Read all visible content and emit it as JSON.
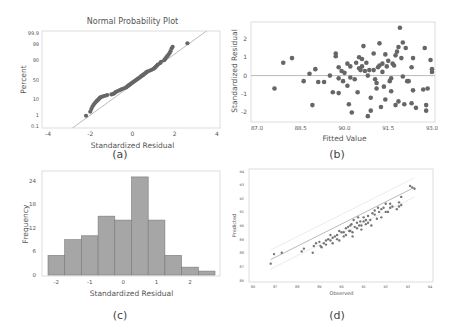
{
  "captions": {
    "a": "(a)",
    "b": "(b)",
    "c": "(c)",
    "d": "(d)"
  },
  "colors": {
    "marker": "#666666",
    "fit_line": "#bbbbbb",
    "bar_fill": "#a6a6a6",
    "bar_edge": "#7a7a7a",
    "frame": "#dddddd",
    "text": "#555555"
  },
  "chart_data": [
    {
      "id": "a",
      "type": "scatter",
      "title": "Normal Probability Plot",
      "xlabel": "Standardized Residual",
      "ylabel": "Percent",
      "xlim": [
        -4,
        4
      ],
      "xticks": [
        -4,
        -2,
        0,
        2,
        4
      ],
      "yticks": [
        0.1,
        1,
        10,
        50,
        90,
        99,
        99.9
      ],
      "ytick_labels": [
        "0.1",
        "1",
        "10",
        "50",
        "90",
        "99",
        "99.9"
      ],
      "grid": false,
      "reference_line": {
        "from": [
          -3.1,
          0.1
        ],
        "to": [
          3.1,
          99.9
        ]
      },
      "points": [
        [
          -2.2,
          0.8
        ],
        [
          -2.0,
          1.6
        ],
        [
          -1.95,
          2.5
        ],
        [
          -1.9,
          3.5
        ],
        [
          -1.85,
          4.5
        ],
        [
          -1.8,
          5.5
        ],
        [
          -1.75,
          6.5
        ],
        [
          -1.7,
          7.5
        ],
        [
          -1.65,
          8.5
        ],
        [
          -1.6,
          9.5
        ],
        [
          -1.55,
          11
        ],
        [
          -1.5,
          12
        ],
        [
          -1.4,
          13
        ],
        [
          -1.3,
          14
        ],
        [
          -1.2,
          15
        ],
        [
          -1.0,
          16
        ],
        [
          -0.9,
          17
        ],
        [
          -0.85,
          18.5
        ],
        [
          -0.8,
          20
        ],
        [
          -0.7,
          22
        ],
        [
          -0.6,
          24
        ],
        [
          -0.5,
          26
        ],
        [
          -0.4,
          28
        ],
        [
          -0.3,
          30
        ],
        [
          -0.25,
          32
        ],
        [
          -0.2,
          34
        ],
        [
          -0.15,
          36
        ],
        [
          -0.1,
          38
        ],
        [
          -0.05,
          40
        ],
        [
          0.0,
          42
        ],
        [
          0.05,
          44
        ],
        [
          0.1,
          46
        ],
        [
          0.15,
          48
        ],
        [
          0.2,
          50
        ],
        [
          0.25,
          52
        ],
        [
          0.3,
          54
        ],
        [
          0.35,
          56
        ],
        [
          0.4,
          58
        ],
        [
          0.45,
          60
        ],
        [
          0.5,
          62
        ],
        [
          0.55,
          64
        ],
        [
          0.6,
          66
        ],
        [
          0.65,
          68
        ],
        [
          0.7,
          70
        ],
        [
          0.8,
          72
        ],
        [
          0.9,
          74
        ],
        [
          1.0,
          76
        ],
        [
          1.05,
          78
        ],
        [
          1.1,
          80
        ],
        [
          1.15,
          82
        ],
        [
          1.2,
          84
        ],
        [
          1.3,
          86
        ],
        [
          1.35,
          88
        ],
        [
          1.5,
          90
        ],
        [
          1.55,
          91.5
        ],
        [
          1.6,
          93
        ],
        [
          1.65,
          94
        ],
        [
          1.7,
          95
        ],
        [
          1.75,
          96
        ],
        [
          1.8,
          97
        ],
        [
          1.85,
          98
        ],
        [
          1.9,
          98.5
        ],
        [
          2.6,
          99.2
        ]
      ]
    },
    {
      "id": "b",
      "type": "scatter",
      "title": "",
      "xlabel": "Fitted Value",
      "ylabel": "Standardized Residual",
      "xlim": [
        87.0,
        93.0
      ],
      "ylim": [
        -2.3,
        2.8
      ],
      "xticks": [
        87.0,
        88.5,
        90.0,
        91.5,
        93.0
      ],
      "xtick_labels": [
        "87.0",
        "88.5",
        "90.0",
        "91.5",
        "93.0"
      ],
      "yticks": [
        -2,
        -1,
        0,
        1,
        2
      ],
      "grid": false,
      "reference_line": {
        "y": 0
      },
      "points": [
        [
          87.6,
          -0.7
        ],
        [
          87.9,
          0.7
        ],
        [
          88.2,
          0.95
        ],
        [
          88.6,
          -0.3
        ],
        [
          88.8,
          0.1
        ],
        [
          88.9,
          -1.6
        ],
        [
          89.0,
          0.35
        ],
        [
          89.1,
          -0.35
        ],
        [
          89.3,
          -0.35
        ],
        [
          89.5,
          0.0
        ],
        [
          89.6,
          -0.9
        ],
        [
          89.7,
          1.2
        ],
        [
          89.7,
          1.05
        ],
        [
          89.8,
          0.45
        ],
        [
          89.8,
          -0.15
        ],
        [
          89.8,
          -0.95
        ],
        [
          89.9,
          0.25
        ],
        [
          89.95,
          -0.3
        ],
        [
          90.0,
          0.15
        ],
        [
          90.1,
          0.65
        ],
        [
          90.1,
          -0.55
        ],
        [
          90.15,
          -1.55
        ],
        [
          90.2,
          0.5
        ],
        [
          90.2,
          -0.1
        ],
        [
          90.25,
          -2.0
        ],
        [
          90.35,
          -0.2
        ],
        [
          90.4,
          0.7
        ],
        [
          90.45,
          -0.9
        ],
        [
          90.5,
          1.0
        ],
        [
          90.5,
          0.4
        ],
        [
          90.55,
          0.3
        ],
        [
          90.6,
          0.9
        ],
        [
          90.6,
          0.5
        ],
        [
          90.65,
          1.6
        ],
        [
          90.7,
          0.25
        ],
        [
          90.75,
          0.7
        ],
        [
          90.8,
          0.0
        ],
        [
          90.8,
          -2.2
        ],
        [
          90.85,
          0.3
        ],
        [
          90.9,
          -1.2
        ],
        [
          90.9,
          -1.9
        ],
        [
          91.0,
          0.3
        ],
        [
          91.0,
          1.2
        ],
        [
          91.05,
          -0.2
        ],
        [
          91.1,
          -0.7
        ],
        [
          91.1,
          -0.4
        ],
        [
          91.15,
          0.45
        ],
        [
          91.2,
          0.55
        ],
        [
          91.2,
          1.75
        ],
        [
          91.25,
          -1.7
        ],
        [
          91.3,
          0.2
        ],
        [
          91.3,
          0.65
        ],
        [
          91.35,
          -0.6
        ],
        [
          91.4,
          1.15
        ],
        [
          91.4,
          -1.3
        ],
        [
          91.45,
          0.5
        ],
        [
          91.5,
          0.8
        ],
        [
          91.55,
          -0.3
        ],
        [
          91.6,
          -0.15
        ],
        [
          91.6,
          -0.85
        ],
        [
          91.65,
          0.65
        ],
        [
          91.7,
          0.55
        ],
        [
          91.75,
          1.1
        ],
        [
          91.75,
          -1.6
        ],
        [
          91.8,
          1.3
        ],
        [
          91.85,
          1.55
        ],
        [
          91.85,
          -1.4
        ],
        [
          91.9,
          2.6
        ],
        [
          91.95,
          0.95
        ],
        [
          92.0,
          -0.05
        ],
        [
          92.0,
          1.8
        ],
        [
          92.05,
          -1.55
        ],
        [
          92.1,
          1.5
        ],
        [
          92.15,
          -0.3
        ],
        [
          92.2,
          -0.3
        ],
        [
          92.3,
          0.45
        ],
        [
          92.3,
          -1.5
        ],
        [
          92.35,
          0.95
        ],
        [
          92.35,
          -0.8
        ],
        [
          92.45,
          -1.75
        ],
        [
          92.7,
          -0.75
        ],
        [
          92.75,
          1.5
        ],
        [
          92.8,
          -1.6
        ],
        [
          92.8,
          -1.9
        ],
        [
          92.85,
          -0.7
        ],
        [
          92.95,
          0.85
        ],
        [
          93.0,
          0.35
        ],
        [
          93.0,
          0.2
        ]
      ]
    },
    {
      "id": "c",
      "type": "bar",
      "title": "",
      "xlabel": "Standardized Residual",
      "ylabel": "Frequency",
      "bin_edges": [
        -2.25,
        -1.75,
        -1.25,
        -0.75,
        -0.25,
        0.25,
        0.75,
        1.25,
        1.75,
        2.25,
        2.75
      ],
      "values": [
        5,
        9,
        10,
        15,
        14,
        25,
        14,
        5,
        2,
        1
      ],
      "xticks": [
        -2,
        -1,
        0,
        1,
        2
      ],
      "yticks": [
        0,
        6,
        12,
        18,
        24
      ],
      "ylim": [
        0,
        26
      ],
      "grid": false
    },
    {
      "id": "d",
      "type": "scatter",
      "title": "",
      "xlabel": "Observed",
      "ylabel": "Predicted",
      "xlim": [
        86,
        94
      ],
      "ylim": [
        86,
        94
      ],
      "xticks": [
        86,
        87,
        88,
        89,
        90,
        91,
        92,
        93,
        94
      ],
      "yticks": [
        86,
        87,
        88,
        89,
        90,
        91,
        92,
        93,
        94
      ],
      "grid": false,
      "fit_line": {
        "from": [
          86.8,
          87.5
        ],
        "to": [
          93.3,
          92.8
        ]
      },
      "confidence_band": {
        "offset": 0.7
      },
      "points": [
        [
          86.8,
          87.2
        ],
        [
          86.95,
          87.9
        ],
        [
          87.3,
          88.0
        ],
        [
          88.2,
          88.1
        ],
        [
          88.3,
          88.3
        ],
        [
          88.7,
          88.0
        ],
        [
          88.75,
          88.5
        ],
        [
          88.85,
          88.7
        ],
        [
          89.0,
          88.8
        ],
        [
          89.05,
          88.5
        ],
        [
          89.1,
          88.4
        ],
        [
          89.2,
          88.7
        ],
        [
          89.3,
          88.9
        ],
        [
          89.3,
          88.6
        ],
        [
          89.4,
          89.0
        ],
        [
          89.5,
          88.9
        ],
        [
          89.5,
          89.3
        ],
        [
          89.6,
          89.1
        ],
        [
          89.6,
          88.7
        ],
        [
          89.7,
          89.2
        ],
        [
          89.8,
          89.3
        ],
        [
          89.8,
          89.0
        ],
        [
          89.9,
          89.6
        ],
        [
          89.9,
          88.9
        ],
        [
          90.0,
          89.5
        ],
        [
          90.1,
          89.5
        ],
        [
          90.1,
          89.2
        ],
        [
          90.2,
          89.8
        ],
        [
          90.2,
          89.3
        ],
        [
          90.3,
          89.9
        ],
        [
          90.35,
          89.6
        ],
        [
          90.4,
          89.6
        ],
        [
          90.4,
          90.0
        ],
        [
          90.45,
          90.1
        ],
        [
          90.5,
          89.5
        ],
        [
          90.5,
          89.2
        ],
        [
          90.55,
          90.4
        ],
        [
          90.6,
          89.9
        ],
        [
          90.7,
          90.2
        ],
        [
          90.7,
          89.8
        ],
        [
          90.75,
          90.6
        ],
        [
          90.8,
          90.0
        ],
        [
          90.85,
          90.3
        ],
        [
          90.9,
          90.0
        ],
        [
          90.9,
          89.7
        ],
        [
          91.0,
          90.3
        ],
        [
          91.0,
          90.6
        ],
        [
          91.1,
          90.1
        ],
        [
          91.1,
          90.4
        ],
        [
          91.2,
          90.2
        ],
        [
          91.2,
          90.7
        ],
        [
          91.3,
          90.4
        ],
        [
          91.35,
          90.0
        ],
        [
          91.4,
          90.9
        ],
        [
          91.5,
          90.8
        ],
        [
          91.5,
          91.1
        ],
        [
          91.6,
          90.5
        ],
        [
          91.65,
          91.3
        ],
        [
          91.7,
          91.0
        ],
        [
          91.8,
          91.2
        ],
        [
          91.8,
          90.6
        ],
        [
          91.9,
          91.3
        ],
        [
          92.0,
          91.0
        ],
        [
          92.0,
          91.6
        ],
        [
          92.1,
          91.0
        ],
        [
          92.2,
          91.3
        ],
        [
          92.2,
          91.6
        ],
        [
          92.3,
          91.4
        ],
        [
          92.5,
          91.2
        ],
        [
          92.6,
          91.4
        ],
        [
          92.6,
          91.7
        ],
        [
          92.7,
          92.1
        ],
        [
          92.7,
          91.5
        ],
        [
          93.1,
          92.9
        ],
        [
          93.2,
          92.8
        ],
        [
          93.3,
          92.7
        ]
      ]
    }
  ]
}
